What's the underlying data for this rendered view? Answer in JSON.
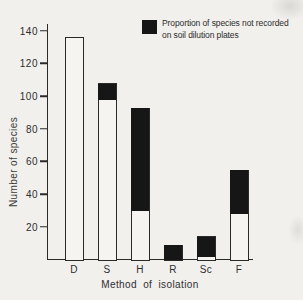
{
  "figure": {
    "background": "#f1f0ed",
    "ink": "#2a2a2a",
    "bar_fill": "#f5f4f1",
    "black_fill": "#161616"
  },
  "chart_data": {
    "type": "bar",
    "stacked": true,
    "title": "",
    "xlabel": "Method of isolation",
    "ylabel": "Number of species",
    "categories": [
      "D",
      "S",
      "H",
      "R",
      "Sc",
      "F"
    ],
    "series": [
      {
        "name": "unshaded (recorded on soil dilution plates)",
        "color": "#f5f4f1",
        "values": [
          136,
          98,
          30,
          0,
          2,
          28
        ]
      },
      {
        "name": "shaded (not recorded on soil dilution plates)",
        "color": "#161616",
        "values": [
          0,
          10,
          63,
          9,
          12,
          27
        ]
      }
    ],
    "totals": [
      136,
      108,
      93,
      9,
      14,
      55
    ],
    "yticks": [
      140,
      120,
      100,
      80,
      60,
      40,
      20
    ],
    "ylim": [
      0,
      145
    ],
    "grid": false,
    "legend": {
      "position": "top-right",
      "line1": "Proportion of species not recorded",
      "line2": "on soil dilution plates"
    }
  }
}
